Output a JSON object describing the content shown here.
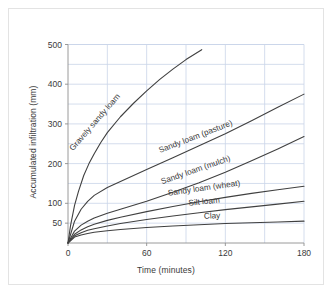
{
  "chart_data": {
    "type": "line",
    "title": "",
    "xlabel": "Time (minutes)",
    "ylabel": "Accumulated infiltration (mm)",
    "xlim": [
      0,
      180
    ],
    "ylim": [
      0,
      520
    ],
    "xticks": [
      "0",
      "60",
      "120",
      "180"
    ],
    "xtick_values": [
      0,
      60,
      120,
      180
    ],
    "yticks": [
      "50",
      "100",
      "200",
      "300",
      "400",
      "500"
    ],
    "ytick_values": [
      50,
      100,
      200,
      300,
      400,
      500
    ],
    "grid": true,
    "grid_interval": 50,
    "legend": "inline-curve-labels",
    "line_color": "#404040",
    "grid_color": "#c9d4e8",
    "axis_color": "#8f8f8f",
    "x": [
      0,
      5,
      10,
      15,
      20,
      30,
      40,
      50,
      60,
      80,
      100,
      120,
      140,
      160,
      180
    ],
    "series": [
      {
        "name": "Gravely sandy loam",
        "label": "Gravely sandy loam",
        "x": [
          0,
          2,
          5,
          8,
          12,
          16,
          20,
          25,
          30,
          40,
          50,
          60,
          70,
          80,
          90,
          102
        ],
        "values": [
          0,
          45,
          95,
          130,
          170,
          200,
          225,
          253,
          278,
          318,
          352,
          383,
          412,
          438,
          462,
          487
        ]
      },
      {
        "name": "Sandy loam (pasture)",
        "label": "Sandy loam (pasture)",
        "x": [
          0,
          5,
          10,
          15,
          20,
          30,
          40,
          60,
          80,
          100,
          120,
          140,
          160,
          180
        ],
        "values": [
          0,
          55,
          85,
          105,
          120,
          140,
          155,
          185,
          215,
          245,
          275,
          308,
          342,
          375
        ]
      },
      {
        "name": "Sandy loam (mulch)",
        "label": "Sandy loam (mulch)",
        "x": [
          0,
          5,
          10,
          15,
          20,
          30,
          40,
          60,
          80,
          100,
          120,
          140,
          160,
          180
        ],
        "values": [
          0,
          30,
          45,
          55,
          63,
          75,
          85,
          105,
          128,
          152,
          178,
          207,
          237,
          268
        ]
      },
      {
        "name": "Sandy loam (wheat)",
        "label": "Sandy loam (wheat)",
        "x": [
          0,
          5,
          10,
          15,
          20,
          30,
          40,
          60,
          80,
          100,
          120,
          140,
          160,
          180
        ],
        "values": [
          0,
          22,
          33,
          41,
          47,
          57,
          65,
          79,
          92,
          104,
          115,
          125,
          134,
          143
        ]
      },
      {
        "name": "Silt loam",
        "label": "Silt loam",
        "x": [
          0,
          5,
          10,
          15,
          20,
          30,
          40,
          60,
          80,
          100,
          120,
          140,
          160,
          180
        ],
        "values": [
          0,
          18,
          26,
          32,
          36,
          43,
          49,
          59,
          68,
          76,
          84,
          91,
          98,
          105
        ]
      },
      {
        "name": "Clay",
        "label": "Clay",
        "x": [
          0,
          5,
          10,
          15,
          20,
          30,
          40,
          60,
          80,
          100,
          120,
          140,
          160,
          180
        ],
        "values": [
          0,
          15,
          20,
          24,
          27,
          31,
          34,
          39,
          43,
          46,
          49,
          51,
          53,
          55
        ]
      }
    ],
    "annotations": [
      {
        "text": "Gravely sandy loam",
        "x": 22,
        "y": 300,
        "rotation": -49
      },
      {
        "text": "Sandy loam (pasture)",
        "x": 98,
        "y": 262,
        "rotation": -21
      },
      {
        "text": "Sandy loam (mulch)",
        "x": 98,
        "y": 178,
        "rotation": -19
      },
      {
        "text": "Sandy loam (wheat)",
        "x": 104,
        "y": 132,
        "rotation": -8
      },
      {
        "text": "Silt loam",
        "x": 104,
        "y": 98,
        "rotation": -6
      },
      {
        "text": "Clay",
        "x": 110,
        "y": 62,
        "rotation": -3
      }
    ]
  }
}
